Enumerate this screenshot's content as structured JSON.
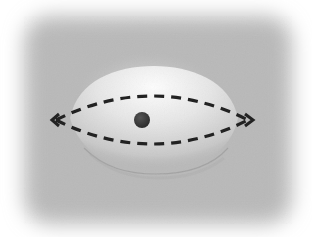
{
  "diagram": {
    "colors": {
      "background_outer": "#ffffff",
      "background_panel": "#b8b8b8",
      "dome_highlight": "#fafafa",
      "dome_shadow": "#a9a9a9",
      "hole": "#3a3a3a",
      "dashed_line": "#222222"
    },
    "elements": {
      "panel": {
        "x": 22,
        "y": 14,
        "width": 272,
        "height": 212,
        "rx": 26
      },
      "dome": {
        "cx": 152,
        "cy": 120,
        "rx": 84,
        "ry": 54
      },
      "hole": {
        "cx": 142,
        "cy": 120,
        "r": 8
      },
      "outline": {
        "left_tip": [
          52,
          120
        ],
        "right_tip": [
          252,
          120
        ],
        "top_y": 96,
        "bottom_y": 145,
        "style": "dashed"
      },
      "arrowheads": [
        "left",
        "right"
      ]
    }
  }
}
